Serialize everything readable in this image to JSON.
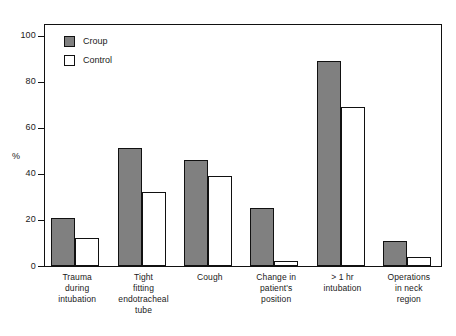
{
  "chart_data": {
    "type": "bar",
    "title": "",
    "xlabel": "",
    "ylabel": "%",
    "ylim": [
      0,
      105
    ],
    "yticks": [
      0,
      20,
      40,
      60,
      80,
      100
    ],
    "ytick_labels": [
      "0",
      "20",
      "40",
      "60",
      "80",
      "100"
    ],
    "grid": false,
    "legend_position": "top-left",
    "categories": [
      "Trauma during intubation",
      "Tight fitting endotracheal tube",
      "Cough",
      "Change in patient's position",
      "> 1 hr intubation",
      "Operations in neck region"
    ],
    "category_lines": [
      [
        "Trauma",
        "during",
        "intubation"
      ],
      [
        "Tight",
        "fitting",
        "endotracheal",
        "tube"
      ],
      [
        "Cough"
      ],
      [
        "Change in",
        "patient's",
        "position"
      ],
      [
        "> 1 hr",
        "intubation"
      ],
      [
        "Operations",
        "in neck",
        "region"
      ]
    ],
    "series": [
      {
        "name": "Croup",
        "color": "#808080",
        "values": [
          21,
          51,
          46,
          25,
          89,
          11
        ]
      },
      {
        "name": "Control",
        "color": "#ffffff",
        "values": [
          12,
          32,
          39,
          2,
          69,
          4
        ]
      }
    ]
  },
  "legend": {
    "items": [
      {
        "label": "Croup",
        "swatch": "filled-gray-square"
      },
      {
        "label": "Control",
        "swatch": "outlined-white-square"
      }
    ]
  },
  "axis": {
    "y_title": "%"
  },
  "colors": {
    "croup_fill": "#808080",
    "control_fill": "#ffffff",
    "outline": "#111111",
    "background": "#ffffff",
    "text": "#1a1a1a"
  }
}
